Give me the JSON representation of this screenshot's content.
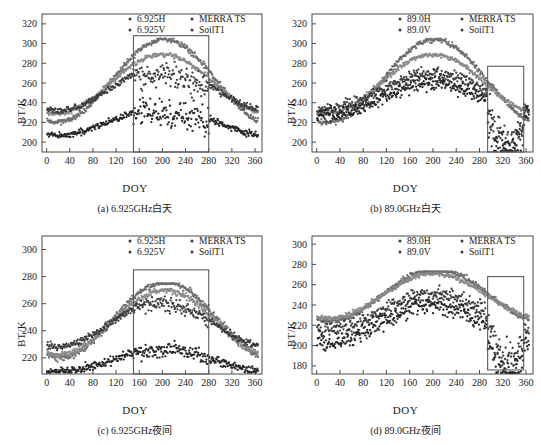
{
  "figure": {
    "axis_y_title": "BT/K",
    "axis_x_title": "DOY",
    "panels": [
      {
        "id": "a",
        "caption": "(a) 6.925GHz白天",
        "legend": [
          "6.925H",
          "MERRA TS",
          "6.925V",
          "SoilT1"
        ],
        "ylim": [
          190,
          330
        ],
        "yticks": [
          200,
          220,
          240,
          260,
          280,
          300,
          320
        ],
        "xlim": [
          -8,
          372
        ],
        "xticks": [
          0,
          40,
          80,
          120,
          160,
          200,
          240,
          280,
          320,
          360
        ],
        "highlight_box": {
          "x0": 150,
          "x1": 280,
          "y0": 190,
          "y1": 308
        }
      },
      {
        "id": "b",
        "caption": "(b) 89.0GHz白天",
        "legend": [
          "89.0H",
          "MERRA TS",
          "89.0V",
          "SoilT1"
        ],
        "ylim": [
          190,
          330
        ],
        "yticks": [
          200,
          220,
          240,
          260,
          280,
          300,
          320
        ],
        "xlim": [
          -8,
          372
        ],
        "xticks": [
          0,
          40,
          80,
          120,
          160,
          200,
          240,
          280,
          320,
          360
        ],
        "highlight_box": {
          "x0": 294,
          "x1": 356,
          "y0": 190,
          "y1": 277
        }
      },
      {
        "id": "c",
        "caption": "(c) 6.925GHz夜间",
        "legend": [
          "6.925H",
          "MERRA TS",
          "6.925V",
          "SoilT1"
        ],
        "ylim": [
          208,
          310
        ],
        "yticks": [
          220,
          240,
          260,
          280,
          300
        ],
        "xlim": [
          -8,
          372
        ],
        "xticks": [
          0,
          40,
          80,
          120,
          160,
          200,
          240,
          280,
          320,
          360
        ],
        "highlight_box": {
          "x0": 150,
          "x1": 280,
          "y0": 208,
          "y1": 285
        }
      },
      {
        "id": "d",
        "caption": "(d) 89.0GHz夜间",
        "legend": [
          "89.0H",
          "MERRA TS",
          "89.0V",
          "SoilT1"
        ],
        "ylim": [
          172,
          308
        ],
        "yticks": [
          180,
          200,
          220,
          240,
          260,
          280,
          300
        ],
        "xlim": [
          -8,
          372
        ],
        "xticks": [
          0,
          40,
          80,
          120,
          160,
          200,
          240,
          280,
          320,
          360
        ],
        "highlight_box": {
          "x0": 294,
          "x1": 356,
          "y0": 176,
          "y1": 268
        }
      }
    ]
  },
  "chart_data": [
    {
      "type": "scatter",
      "panel": "a",
      "title": "(a) 6.925GHz白天",
      "xlabel": "DOY",
      "ylabel": "BT/K",
      "xlim": [
        -8,
        372
      ],
      "ylim": [
        190,
        330
      ],
      "xticks": [
        0,
        40,
        80,
        120,
        160,
        200,
        240,
        280,
        320,
        360
      ],
      "yticks": [
        200,
        220,
        240,
        260,
        280,
        300,
        320
      ],
      "grid": false,
      "legend_position": "top-center",
      "annotations": [
        {
          "type": "rectangle",
          "x0": 150,
          "x1": 280,
          "y0": 190,
          "y1": 308,
          "note": "melt-period highlight"
        }
      ],
      "series": [
        {
          "name": "MERRA TS",
          "color": "#6e6e6e",
          "marker": "dot",
          "model": {
            "kind": "seasonal",
            "base": 262,
            "amp": 42,
            "peak_doy": 203,
            "noise": 2.6,
            "cap": 305,
            "n": 365
          }
        },
        {
          "name": "SoilT1",
          "color": "#8a8a8a",
          "marker": "dot",
          "model": {
            "kind": "seasonal",
            "base": 259,
            "amp": 30,
            "peak_doy": 200,
            "noise": 2.2,
            "cap": 290,
            "n": 365
          }
        },
        {
          "name": "6.925V",
          "color": "#3d3d3d",
          "marker": "dot",
          "model": {
            "kind": "seasonal-scatter",
            "base": 254,
            "amp": 22,
            "peak_doy": 200,
            "noise": 3.0,
            "melt_drop": 8,
            "melt_noise": 12,
            "melt_x0": 150,
            "melt_x1": 280,
            "n": 365
          }
        },
        {
          "name": "6.925H",
          "color": "#262626",
          "marker": "dot",
          "model": {
            "kind": "seasonal-scatter",
            "base": 221,
            "amp": 14,
            "peak_doy": 200,
            "noise": 3.2,
            "melt_drop": 6,
            "melt_noise": 14,
            "melt_x0": 150,
            "melt_x1": 280,
            "n": 365
          }
        }
      ]
    },
    {
      "type": "scatter",
      "panel": "b",
      "title": "(b) 89.0GHz白天",
      "xlabel": "DOY",
      "ylabel": "BT/K",
      "xlim": [
        -8,
        372
      ],
      "ylim": [
        190,
        330
      ],
      "xticks": [
        0,
        40,
        80,
        120,
        160,
        200,
        240,
        280,
        320,
        360
      ],
      "yticks": [
        200,
        220,
        240,
        260,
        280,
        300,
        320
      ],
      "grid": false,
      "legend_position": "top-center",
      "annotations": [
        {
          "type": "rectangle",
          "x0": 294,
          "x1": 356,
          "y0": 190,
          "y1": 277,
          "note": "winter anomaly highlight"
        }
      ],
      "series": [
        {
          "name": "MERRA TS",
          "color": "#6e6e6e",
          "marker": "dot",
          "model": {
            "kind": "seasonal",
            "base": 262,
            "amp": 42,
            "peak_doy": 203,
            "noise": 2.6,
            "cap": 305,
            "n": 365
          }
        },
        {
          "name": "SoilT1",
          "color": "#8a8a8a",
          "marker": "dot",
          "model": {
            "kind": "seasonal",
            "base": 259,
            "amp": 30,
            "peak_doy": 200,
            "noise": 2.2,
            "cap": 290,
            "n": 365
          }
        },
        {
          "name": "89.0V",
          "color": "#3d3d3d",
          "marker": "dot",
          "model": {
            "kind": "seasonal-scatter",
            "base": 252,
            "amp": 18,
            "peak_doy": 200,
            "noise": 6.0,
            "melt_drop": 40,
            "melt_noise": 16,
            "melt_x0": 294,
            "melt_x1": 356,
            "n": 365
          }
        },
        {
          "name": "89.0H",
          "color": "#262626",
          "marker": "dot",
          "model": {
            "kind": "seasonal-scatter",
            "base": 243,
            "amp": 16,
            "peak_doy": 200,
            "noise": 6.5,
            "melt_drop": 42,
            "melt_noise": 16,
            "melt_x0": 294,
            "melt_x1": 356,
            "n": 365
          }
        }
      ]
    },
    {
      "type": "scatter",
      "panel": "c",
      "title": "(c) 6.925GHz夜间",
      "xlabel": "DOY",
      "ylabel": "BT/K",
      "xlim": [
        -8,
        372
      ],
      "ylim": [
        208,
        310
      ],
      "xticks": [
        0,
        40,
        80,
        120,
        160,
        200,
        240,
        280,
        320,
        360
      ],
      "yticks": [
        220,
        240,
        260,
        280,
        300
      ],
      "grid": false,
      "legend_position": "top-center",
      "annotations": [
        {
          "type": "rectangle",
          "x0": 150,
          "x1": 280,
          "y0": 208,
          "y1": 285,
          "note": "melt-period highlight"
        }
      ],
      "series": [
        {
          "name": "MERRA TS",
          "color": "#6e6e6e",
          "marker": "dot",
          "model": {
            "kind": "seasonal",
            "base": 248,
            "amp": 28,
            "peak_doy": 205,
            "noise": 2.4,
            "cap": 275,
            "n": 365
          }
        },
        {
          "name": "SoilT1",
          "color": "#8a8a8a",
          "marker": "dot",
          "model": {
            "kind": "seasonal",
            "base": 246,
            "amp": 24,
            "peak_doy": 203,
            "noise": 2.2,
            "cap": 273,
            "n": 365
          }
        },
        {
          "name": "6.925V",
          "color": "#3d3d3d",
          "marker": "dot",
          "model": {
            "kind": "seasonal-scatter",
            "base": 245,
            "amp": 17,
            "peak_doy": 200,
            "noise": 2.4,
            "melt_drop": 2,
            "melt_noise": 4,
            "melt_x0": 150,
            "melt_x1": 280,
            "n": 365
          }
        },
        {
          "name": "6.925H",
          "color": "#262626",
          "marker": "dot",
          "model": {
            "kind": "seasonal-scatter",
            "base": 218,
            "amp": 8,
            "peak_doy": 200,
            "noise": 3.0,
            "melt_drop": 0,
            "melt_noise": 5,
            "melt_x0": 150,
            "melt_x1": 280,
            "n": 365
          }
        }
      ]
    },
    {
      "type": "scatter",
      "panel": "d",
      "title": "(d) 89.0GHz夜间",
      "xlabel": "DOY",
      "ylabel": "BT/K",
      "xlim": [
        172,
        308
      ],
      "ylim": [
        172,
        308
      ],
      "xticks": [
        0,
        40,
        80,
        120,
        160,
        200,
        240,
        280,
        320,
        360
      ],
      "yticks": [
        180,
        200,
        220,
        240,
        260,
        280,
        300
      ],
      "grid": false,
      "legend_position": "top-center",
      "annotations": [
        {
          "type": "rectangle",
          "x0": 294,
          "x1": 356,
          "y0": 176,
          "y1": 268,
          "note": "winter anomaly highlight"
        }
      ],
      "series": [
        {
          "name": "MERRA TS",
          "color": "#6e6e6e",
          "marker": "dot",
          "model": {
            "kind": "seasonal",
            "base": 250,
            "amp": 26,
            "peak_doy": 205,
            "noise": 2.4,
            "cap": 273,
            "n": 365
          }
        },
        {
          "name": "SoilT1",
          "color": "#8a8a8a",
          "marker": "dot",
          "model": {
            "kind": "seasonal",
            "base": 249,
            "amp": 22,
            "peak_doy": 203,
            "noise": 2.2,
            "cap": 271,
            "n": 365
          }
        },
        {
          "name": "89.0V",
          "color": "#3d3d3d",
          "marker": "dot",
          "model": {
            "kind": "seasonal-scatter",
            "base": 233,
            "amp": 18,
            "peak_doy": 200,
            "noise": 7.5,
            "melt_drop": 38,
            "melt_noise": 18,
            "melt_x0": 294,
            "melt_x1": 356,
            "n": 365
          }
        },
        {
          "name": "89.0H",
          "color": "#262626",
          "marker": "dot",
          "model": {
            "kind": "seasonal-scatter",
            "base": 221,
            "amp": 18,
            "peak_doy": 200,
            "noise": 8.0,
            "melt_drop": 36,
            "melt_noise": 18,
            "melt_x0": 294,
            "melt_x1": 356,
            "n": 365
          }
        }
      ]
    }
  ]
}
